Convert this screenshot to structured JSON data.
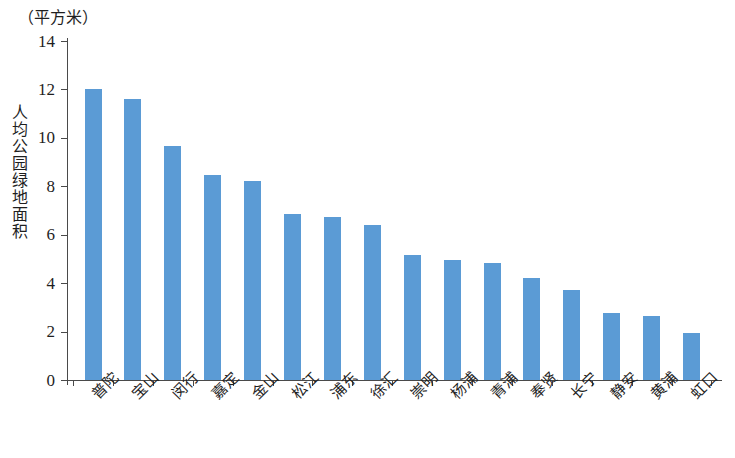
{
  "chart_data": {
    "type": "bar",
    "title": "",
    "subtitle": "",
    "unit_caption": "（平方米）",
    "xlabel": "",
    "ylabel": "人均公园绿地面积",
    "ylim": [
      0,
      14
    ],
    "yticks": [
      0,
      2,
      4,
      6,
      8,
      10,
      12,
      14
    ],
    "ytick_labels": [
      "0",
      "2",
      "4",
      "6",
      "8",
      "10",
      "12",
      "14"
    ],
    "grid": false,
    "legend": null,
    "bar_color": "#5b9bd5",
    "axis_color": "#4a4a4a",
    "categories": [
      "普陀",
      "宝山",
      "闵行",
      "嘉定",
      "金山",
      "松江",
      "浦东",
      "徐汇",
      "崇明",
      "杨浦",
      "青浦",
      "奉贤",
      "长宁",
      "静安",
      "黄浦",
      "虹口"
    ],
    "values": [
      12.0,
      11.6,
      9.65,
      8.45,
      8.2,
      6.85,
      6.75,
      6.4,
      5.15,
      4.95,
      4.85,
      4.2,
      3.7,
      2.75,
      2.65,
      1.95
    ]
  }
}
